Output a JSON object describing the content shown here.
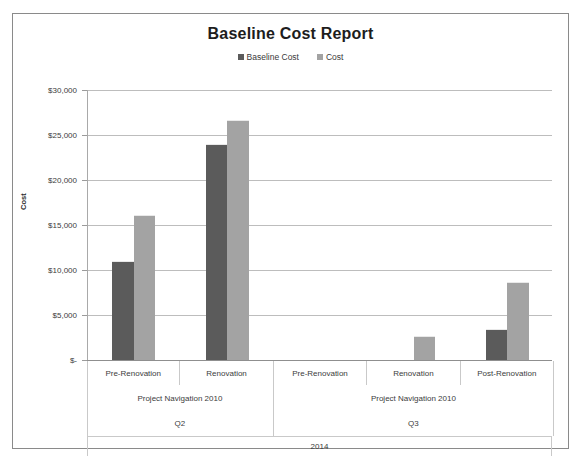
{
  "chart_data": {
    "type": "bar",
    "title": "Baseline Cost Report",
    "xlabel": "",
    "ylabel": "Cost",
    "ylim": [
      0,
      30000
    ],
    "grid": true,
    "legend_position": "top-center",
    "categories": [
      "Pre-Renovation",
      "Renovation",
      "Pre-Renovation",
      "Renovation",
      "Post-Renovation"
    ],
    "groups": [
      {
        "label": "Project Navigation  2010",
        "quarter": "Q2",
        "span": 2
      },
      {
        "label": "Project Navigation  2010",
        "quarter": "Q3",
        "span": 3
      }
    ],
    "year": "2014",
    "series": [
      {
        "name": "Baseline Cost",
        "color": "#5b5b5b",
        "values": [
          11000,
          24000,
          0,
          0,
          3400
        ]
      },
      {
        "name": "Cost",
        "color": "#a3a3a3",
        "values": [
          16100,
          26700,
          0,
          2700,
          8700
        ]
      }
    ],
    "y_ticks": [
      {
        "value": 30000,
        "label": "$30,000"
      },
      {
        "value": 25000,
        "label": "$25,000"
      },
      {
        "value": 20000,
        "label": "$20,000"
      },
      {
        "value": 15000,
        "label": "$15,000"
      },
      {
        "value": 10000,
        "label": "$10,000"
      },
      {
        "value": 5000,
        "label": "$5,000"
      },
      {
        "value": 0,
        "label": "$-"
      }
    ]
  }
}
